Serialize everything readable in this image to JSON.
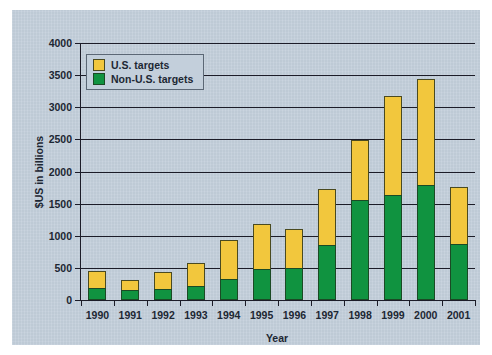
{
  "chart_data": {
    "type": "bar",
    "subtype": "stacked-vertical",
    "title": "",
    "xlabel": "Year",
    "ylabel": "$US in billions",
    "categories": [
      "1990",
      "1991",
      "1992",
      "1993",
      "1994",
      "1995",
      "1996",
      "1997",
      "1998",
      "1999",
      "2000",
      "2001"
    ],
    "ylim": [
      0,
      4000
    ],
    "yticks": [
      0,
      500,
      1000,
      1500,
      2000,
      2500,
      3000,
      3500,
      4000
    ],
    "ytick_labels": [
      "0",
      "500",
      "1000",
      "1500",
      "2000",
      "2500",
      "3000",
      "3500",
      "4000"
    ],
    "grid": true,
    "legend_position": "upper-left-inside",
    "series": [
      {
        "name": "Non-U.S. targets",
        "color": "#109340",
        "values": [
          190,
          150,
          170,
          220,
          320,
          490,
          500,
          860,
          1560,
          1630,
          1790,
          870
        ]
      },
      {
        "name": "U.S. targets",
        "color": "#f2c73d",
        "values": [
          260,
          160,
          260,
          350,
          610,
          690,
          600,
          870,
          930,
          1540,
          1650,
          890
        ]
      }
    ],
    "totals": [
      450,
      310,
      430,
      570,
      930,
      1180,
      1100,
      1730,
      2490,
      3170,
      3440,
      1760
    ],
    "legend": [
      {
        "label": "U.S. targets",
        "color": "#f2c73d"
      },
      {
        "label": "Non-U.S. targets",
        "color": "#109340"
      }
    ]
  },
  "colors": {
    "panel_background": "#c3cfdb",
    "page_background": "#ffffff",
    "axis": "#1c1c28",
    "text": "#1d2733",
    "us_targets": "#f2c73d",
    "non_us_targets": "#109340"
  }
}
